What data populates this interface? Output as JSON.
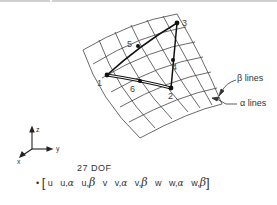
{
  "figure": {
    "type": "shell-element-diagram",
    "nodes": [
      {
        "id": "1",
        "label": "1"
      },
      {
        "id": "2",
        "label": "2"
      },
      {
        "id": "3",
        "label": "3"
      },
      {
        "id": "4",
        "label": "4"
      },
      {
        "id": "5",
        "label": "5"
      },
      {
        "id": "6",
        "label": "6"
      }
    ],
    "mesh_labels": {
      "beta_lines": "β lines",
      "alpha_lines": "α lines"
    },
    "axes": {
      "z": "z",
      "y": "y",
      "x": "x"
    },
    "dof": {
      "title": "27 DOF",
      "bullet": "•",
      "open_bracket": "[",
      "close_bracket": "]",
      "terms": [
        {
          "base": "u",
          "sub": ""
        },
        {
          "base": "u,",
          "sub": "α"
        },
        {
          "base": "u,",
          "sub": "β"
        },
        {
          "base": "v",
          "sub": ""
        },
        {
          "base": "v,",
          "sub": "α"
        },
        {
          "base": "v,",
          "sub": "β"
        },
        {
          "base": "w",
          "sub": ""
        },
        {
          "base": "w,",
          "sub": "α"
        },
        {
          "base": "w,",
          "sub": "β"
        }
      ]
    },
    "colors": {
      "line": "#333333",
      "background": "#ffffff"
    }
  }
}
